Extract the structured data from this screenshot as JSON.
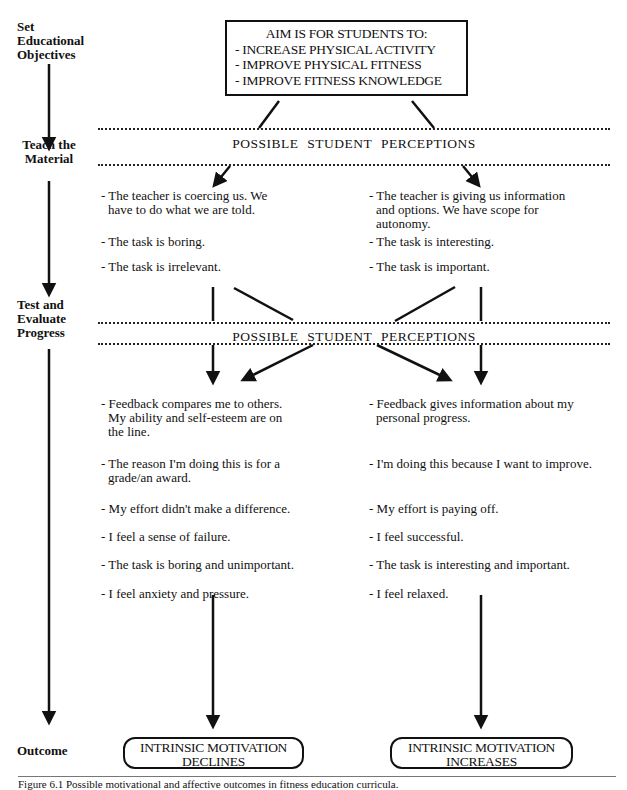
{
  "stages": {
    "objectives": [
      "Set",
      "Educational",
      "Objectives"
    ],
    "teach": [
      "Teach the",
      "Material"
    ],
    "test": [
      "Test and",
      "Evaluate",
      "Progress"
    ],
    "outcome": "Outcome"
  },
  "aim_box": {
    "title": "AIM IS FOR STUDENTS TO:",
    "items": [
      "- INCREASE PHYSICAL ACTIVITY",
      "- IMPROVE PHYSICAL FITNESS",
      "- IMPROVE FITNESS KNOWLEDGE"
    ]
  },
  "band_label": "POSSIBLE STUDENT PERCEPTIONS",
  "teach_perceptions": {
    "negative": [
      {
        "line1": "- The teacher is coercing us.  We",
        "line2": "have to do what we are told."
      },
      {
        "line1": "- The task is boring."
      },
      {
        "line1": "- The task is irrelevant."
      }
    ],
    "positive": [
      {
        "line1": "- The teacher is giving us information",
        "line2": "and options.  We have scope for",
        "line3": "autonomy."
      },
      {
        "line1": "- The task is interesting."
      },
      {
        "line1": "- The task is important."
      }
    ]
  },
  "test_perceptions": {
    "negative": [
      {
        "line1": "- Feedback compares me to others.",
        "line2": "My ability and self-esteem are on",
        "line3": "the line."
      },
      {
        "line1": "- The reason I'm doing this is for a",
        "line2": "grade/an award."
      },
      {
        "line1": "- My effort didn't make a difference."
      },
      {
        "line1": "- I feel a sense of failure."
      },
      {
        "line1": "- The task is boring and unimportant."
      },
      {
        "line1": "- I feel anxiety and pressure."
      }
    ],
    "positive": [
      {
        "line1": "- Feedback gives information about my",
        "line2": "personal progress."
      },
      {
        "line1": "- I'm doing this because I want to improve."
      },
      {
        "line1": "- My effort is paying off."
      },
      {
        "line1": "- I feel successful."
      },
      {
        "line1": "- The task is interesting and important."
      },
      {
        "line1": "- I feel relaxed."
      }
    ]
  },
  "outcomes": {
    "negative": {
      "line1": "INTRINSIC MOTIVATION",
      "line2": "DECLINES"
    },
    "positive": {
      "line1": "INTRINSIC MOTIVATION",
      "line2": "INCREASES"
    }
  },
  "caption": "Figure 6.1  Possible motivational and affective outcomes in fitness education curricula."
}
